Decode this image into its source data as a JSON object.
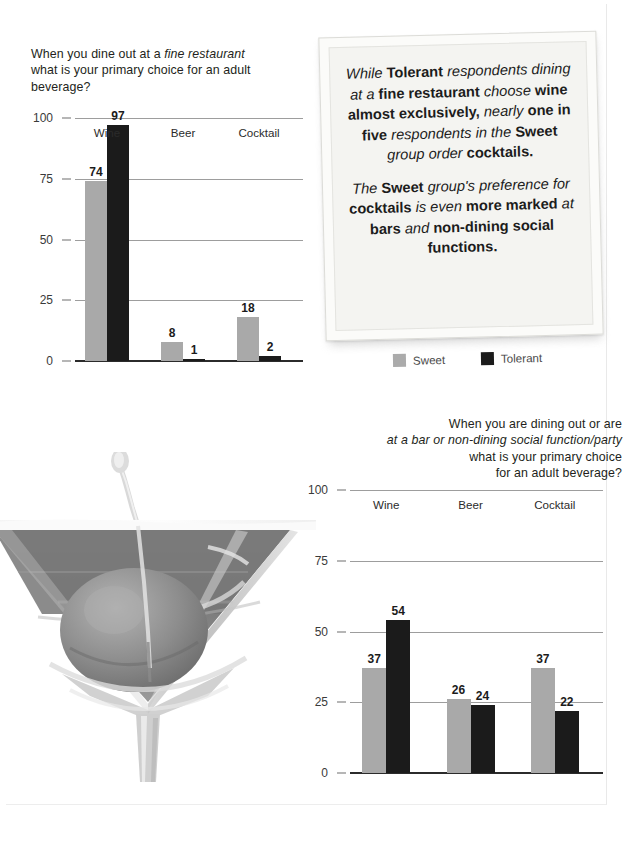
{
  "legend": {
    "sweet_label": "Sweet",
    "tolerant_label": "Tolerant",
    "sweet_color": "#a9a9a9",
    "tolerant_color": "#1b1b1b"
  },
  "callout": {
    "paragraph1_html": "<i>While</i> <b>Tolerant</b> <i>respondents dining at a</i> <b>fine restaurant</b> <i>choose</i> <b>wine almost exclusively,</b> <i>nearly</i> <b>one in five</b> <i>respondents in the</i> <b>Sweet</b> <i>group order</i> <b>cocktails.</b>",
    "paragraph2_html": "<i>The</i> <b>Sweet</b> <i>group's preference for</i> <b>cocktails</b> <i>is even</i> <b>more marked</b> <i>at</i> <b>bars</b> <i>and</i> <b>non-dining social functions.</b>",
    "paragraph1_text": "While Tolerant respondents dining at a fine restaurant choose wine almost exclusively, nearly one in five respondents in the Sweet group order cocktails.",
    "paragraph2_text": "The Sweet group's preference for cocktails is even more marked at bars and non-dining social functions."
  },
  "photo": {
    "alt": "martini-glass-with-olive"
  },
  "chart_data": [
    {
      "id": "fine-restaurant",
      "type": "bar",
      "title": "When you dine out at a fine restaurant what is your primary choice for an adult beverage?",
      "title_html": "When you dine out at a <i>fine restaurant</i><br>what is your primary choice for an adult<br>beverage?",
      "categories": [
        "Wine",
        "Beer",
        "Cocktail"
      ],
      "series": [
        {
          "name": "Sweet",
          "color": "#a9a9a9",
          "values": [
            74,
            8,
            18
          ]
        },
        {
          "name": "Tolerant",
          "color": "#1b1b1b",
          "values": [
            97,
            1,
            2
          ]
        }
      ],
      "xlabel": "",
      "ylabel": "",
      "ylim": [
        0,
        100
      ],
      "yticks": [
        0,
        25,
        50,
        75,
        100
      ],
      "grid": true,
      "legend_position": "below-callout"
    },
    {
      "id": "bar-or-social-function",
      "type": "bar",
      "title": "When you are dining out or are at a bar or non-dining social function/party what is your primary choice for an adult beverage?",
      "title_html": "When you are dining out or are<br><i>at a bar or non-dining social function/party</i><br>what is your primary choice<br>for an adult beverage?",
      "categories": [
        "Wine",
        "Beer",
        "Cocktail"
      ],
      "series": [
        {
          "name": "Sweet",
          "color": "#a9a9a9",
          "values": [
            37,
            26,
            37
          ]
        },
        {
          "name": "Tolerant",
          "color": "#1b1b1b",
          "values": [
            54,
            24,
            22
          ]
        }
      ],
      "xlabel": "",
      "ylabel": "",
      "ylim": [
        0,
        100
      ],
      "yticks": [
        0,
        25,
        50,
        75,
        100
      ],
      "grid": true,
      "legend_position": "none"
    }
  ]
}
